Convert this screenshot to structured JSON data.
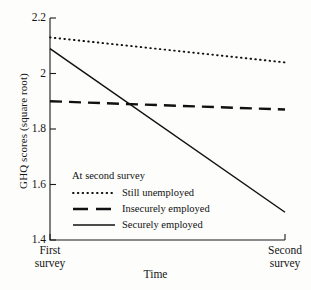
{
  "chart_data": {
    "type": "line",
    "title": "",
    "xlabel": "Time",
    "ylabel": "GHQ scores (square root)",
    "x": [
      "First survey",
      "Second survey"
    ],
    "xtick_labels": [
      "First\nsurvey",
      "Second\nsurvey"
    ],
    "ylim": [
      1.4,
      2.2
    ],
    "yticks": [
      2.2,
      2,
      1.8,
      1.6,
      1.4
    ],
    "ytick_labels": [
      "2.2",
      "2",
      "1.8",
      "1.6",
      "1.4"
    ],
    "grid": false,
    "legend_position": "lower-left-inside",
    "legend_title": "At second survey",
    "series": [
      {
        "name": "Still unemployed",
        "style": "dotted",
        "values": [
          2.13,
          2.04
        ]
      },
      {
        "name": "Insecurely employed",
        "style": "dashed",
        "values": [
          1.9,
          1.87
        ]
      },
      {
        "name": "Securely employed",
        "style": "solid",
        "values": [
          2.09,
          1.5
        ]
      }
    ]
  },
  "axis": {
    "y_label": "GHQ scores (square root)",
    "x_label": "Time",
    "y_tick_labels": [
      "2.2",
      "2",
      "1.8",
      "1.6",
      "1.4"
    ],
    "x_tick_left_line1": "First",
    "x_tick_left_line2": "survey",
    "x_tick_right_line1": "Second",
    "x_tick_right_line2": "survey"
  },
  "legend": {
    "title": "At second survey",
    "entries": [
      {
        "label": "Still unemployed",
        "style": "dotted"
      },
      {
        "label": "Insecurely employed",
        "style": "dashed"
      },
      {
        "label": "Securely employed",
        "style": "solid"
      }
    ]
  },
  "colors": {
    "ink": "#111111",
    "background": "#fdfdfc",
    "axis": "#1a1a1a"
  }
}
